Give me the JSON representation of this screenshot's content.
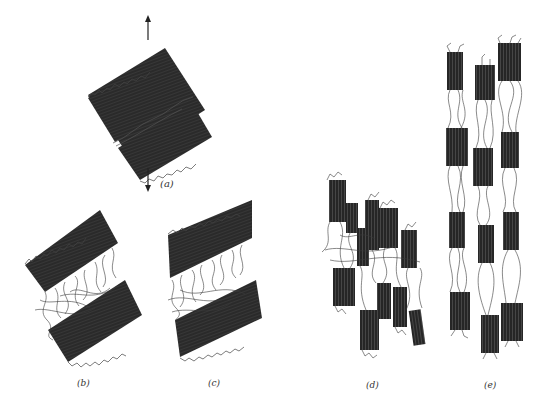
{
  "figure": {
    "type": "schematic diagram",
    "colors": {
      "lamella": "#2a2a2a",
      "chain": "#333333",
      "background": "#ffffff"
    },
    "arrows": {
      "direction": "vertical tensile (up and down)"
    },
    "panels": [
      {
        "id": "a",
        "label": "(a)",
        "description": "Two tilted lamellae stacked with thin amorphous layer, tensile arrows above and below"
      },
      {
        "id": "b",
        "label": "(b)",
        "description": "Lamellae separated; amorphous tie chains stretched between"
      },
      {
        "id": "c",
        "label": "(c)",
        "description": "Lamellae further tilted and separated; amorphous region extended"
      },
      {
        "id": "d",
        "label": "(d)",
        "description": "Lamellae break into crystalline blocks with entangled chains"
      },
      {
        "id": "e",
        "label": "(e)",
        "description": "Blocks aligned into microfibrils connected by tie molecules"
      }
    ]
  }
}
